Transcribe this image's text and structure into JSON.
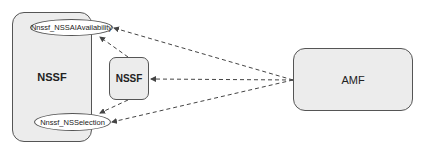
{
  "diagram": {
    "nodes": {
      "nssf_container": {
        "label": "NSSF"
      },
      "nssf_small": {
        "label": "NSSF"
      },
      "amf": {
        "label": "AMF"
      },
      "service_availability": {
        "label": "Nnssf_NSSAIAvailability"
      },
      "service_selection": {
        "label": "Nnssf_NSSelection"
      }
    },
    "edges": [
      {
        "from": "amf",
        "to": "service_availability",
        "style": "dashed"
      },
      {
        "from": "amf",
        "to": "nssf_small",
        "style": "dashed"
      },
      {
        "from": "amf",
        "to": "service_selection",
        "style": "dashed"
      },
      {
        "from": "nssf_small",
        "to": "service_availability",
        "style": "dashed"
      },
      {
        "from": "nssf_small",
        "to": "service_selection",
        "style": "dashed"
      }
    ],
    "colors": {
      "box_fill": "#ececec",
      "stroke": "#555555",
      "arrow": "#444444"
    }
  }
}
